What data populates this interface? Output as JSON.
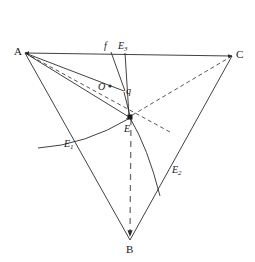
{
  "figure": {
    "name": "triangle-geometry-diagram",
    "background_color": "#ffffff",
    "stroke_color": "#2b2b2b",
    "width": 255,
    "height": 262
  },
  "vertices": [
    {
      "id": "A",
      "label": "A",
      "x": 25,
      "y": 53,
      "label_x": 14,
      "label_y": 47
    },
    {
      "id": "C",
      "label": "C",
      "x": 232,
      "y": 56,
      "label_x": 236,
      "label_y": 50
    },
    {
      "id": "B",
      "label": "B",
      "x": 130,
      "y": 241,
      "label_x": 126,
      "label_y": 244
    }
  ],
  "points": [
    {
      "id": "E",
      "label": "E",
      "sub": "",
      "x": 130,
      "y": 117,
      "label_x": 124,
      "label_y": 125
    },
    {
      "id": "E1",
      "label": "E",
      "sub": "1",
      "x": 74,
      "y": 142,
      "label_x": 64,
      "label_y": 140
    },
    {
      "id": "E2",
      "label": "E",
      "sub": "2",
      "x": 168,
      "y": 166,
      "label_x": 172,
      "label_y": 166
    },
    {
      "id": "E3",
      "label": "E",
      "sub": "3",
      "x": 125,
      "y": 55,
      "label_x": 118,
      "label_y": 42
    },
    {
      "id": "O",
      "label": "O",
      "sub": "",
      "x": 110,
      "y": 86,
      "label_x": 99,
      "label_y": 84
    },
    {
      "id": "q",
      "label": "q",
      "sub": "",
      "x": 124,
      "y": 90,
      "label_x": 126,
      "label_y": 88
    },
    {
      "id": "f",
      "label": "f",
      "sub": "",
      "x": 112,
      "y": 53,
      "label_x": 105,
      "label_y": 42
    }
  ],
  "segments": {
    "side_AC": {
      "name": "segment-AC",
      "style": "solid",
      "arrow_start": true,
      "arrow_end": true
    },
    "side_AB": {
      "name": "segment-AB",
      "style": "solid",
      "arrow_start": false,
      "arrow_end": false
    },
    "side_CB": {
      "name": "segment-CB",
      "style": "solid",
      "arrow_start": false,
      "arrow_end": false
    },
    "cevian_AE": {
      "name": "dashed-line-A-to-E2",
      "style": "dashed"
    },
    "cevian_CE": {
      "name": "dashed-line-C-to-E",
      "style": "dashed"
    },
    "cevian_BE": {
      "name": "dashed-line-E-to-B",
      "style": "dashed",
      "arrow_end": true
    },
    "line_Aq": {
      "name": "solid-line-A-to-q",
      "style": "solid"
    },
    "line_AE": {
      "name": "solid-line-A-to-E",
      "style": "solid"
    },
    "line_fq": {
      "name": "solid-line-f-to-q",
      "style": "solid"
    },
    "line_E3E": {
      "name": "solid-line-E3-to-E",
      "style": "solid"
    },
    "line_qE": {
      "name": "solid-line-q-to-E",
      "style": "solid"
    },
    "arc_E1_E": {
      "name": "arc-E1-through-E",
      "style": "solid-curve"
    },
    "arc_E_E2": {
      "name": "arc-E-to-E2",
      "style": "solid-curve"
    }
  }
}
